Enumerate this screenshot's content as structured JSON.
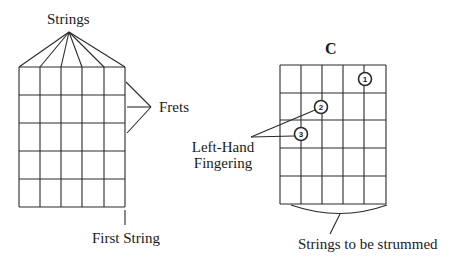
{
  "labels": {
    "strings": "Strings",
    "frets": "Frets",
    "first_string": "First String",
    "chord_name": "C",
    "left_hand_line1": "Left-Hand",
    "left_hand_line2": "Fingering",
    "strummed": "Strings to be strummed"
  },
  "left_diagram": {
    "strings_count": 6,
    "fret_rows": 5,
    "x": [
      19,
      40,
      61,
      82,
      104,
      125
    ],
    "y": [
      67,
      95,
      123,
      151,
      179,
      207
    ]
  },
  "right_diagram": {
    "chord": "C",
    "strings_count": 6,
    "fret_rows": 5,
    "x": [
      280,
      301,
      322,
      343,
      364,
      386
    ],
    "y": [
      65,
      93,
      120,
      148,
      176,
      204
    ],
    "fingering": [
      {
        "finger": "1",
        "string_index": 4,
        "fret": 1,
        "cx": 365,
        "cy": 79
      },
      {
        "finger": "2",
        "string_index": 2,
        "fret": 2,
        "cx": 321,
        "cy": 107
      },
      {
        "finger": "3",
        "string_index": 1,
        "fret": 3,
        "cx": 301,
        "cy": 134
      }
    ]
  },
  "colors": {
    "ink": "#2a2a2a",
    "background": "#ffffff"
  }
}
